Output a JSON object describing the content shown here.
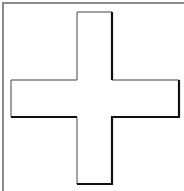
{
  "graphic": {
    "label": "Plus sign",
    "icon": "plus-icon",
    "colors": {
      "background": "#ffffff",
      "frame_border": "#8a8a8a",
      "fill": "#ffffff",
      "outline_light": "#444444",
      "outline_shadow": "#111111"
    }
  }
}
